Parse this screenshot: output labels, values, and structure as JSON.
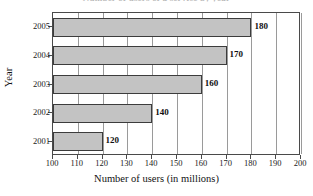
{
  "chart_data": {
    "type": "bar",
    "orientation": "horizontal",
    "title": "Number of users of a service by year",
    "xlabel": "Number of users (in millions)",
    "ylabel": "Year",
    "categories": [
      "2005",
      "2004",
      "2003",
      "2002",
      "2001"
    ],
    "values": [
      180,
      170,
      160,
      140,
      120
    ],
    "value_labels": [
      "180",
      "170",
      "160",
      "140",
      "120"
    ],
    "xlim": [
      100,
      200
    ],
    "xticks": [
      100,
      110,
      120,
      130,
      140,
      150,
      160,
      170,
      180,
      190,
      200
    ],
    "xtick_labels": [
      "100",
      "110",
      "120",
      "130",
      "140",
      "150",
      "160",
      "170",
      "180",
      "190",
      "200"
    ],
    "grid": true,
    "grid_axis": "x",
    "legend": null,
    "bar_color": "#c3c3c3",
    "bar_edge_color": "#3c3c3c",
    "axis_color": "#4a4a4a",
    "grid_color": "#9a9a9a",
    "background_color": "#ffffff",
    "series": [
      {
        "name": "Number of users (in millions)",
        "values": [
          180,
          170,
          160,
          140,
          120
        ]
      }
    ]
  }
}
